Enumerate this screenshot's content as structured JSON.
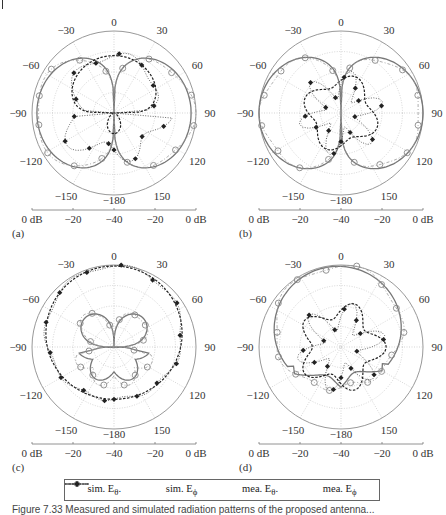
{
  "chart_data": [
    {
      "type": "polar",
      "panel": "(a)",
      "angle_ticks": [
        0,
        30,
        60,
        90,
        120,
        150,
        -180,
        -150,
        -120,
        -90,
        -60,
        -30
      ],
      "radial_scale_labels": [
        "0 dB",
        "-20",
        "-40",
        "-20",
        "0 dB"
      ],
      "rlim_db": [
        -40,
        0
      ],
      "series": [
        {
          "name": "sim. Eθ",
          "style": "solid",
          "shape": "two side lobes, nulls at 0 and 180, max near ±45 and ±135"
        },
        {
          "name": "sim. Eφ",
          "style": "dashed",
          "shape": "circle in upper half ~-12 dB, small lobe at 180"
        },
        {
          "name": "mea. Eθ",
          "style": "dash-dot with circle markers"
        },
        {
          "name": "mea. Eφ",
          "style": "dotted with diamond markers"
        }
      ]
    },
    {
      "type": "polar",
      "panel": "(b)",
      "angle_ticks": [
        0,
        30,
        60,
        90,
        120,
        150,
        -180,
        -150,
        -120,
        -90,
        -60,
        -30
      ],
      "radial_scale_labels": [
        "0 dB",
        "-20",
        "-40",
        "-20",
        "0 dB"
      ],
      "rlim_db": [
        -40,
        0
      ],
      "series": [
        {
          "name": "sim. Eθ",
          "style": "solid",
          "shape": "figure-eight lobes, nulls at 0 and 180"
        },
        {
          "name": "sim. Eφ",
          "style": "dashed",
          "shape": "low level below -20 dB"
        },
        {
          "name": "mea. Eθ",
          "style": "dash-dot with circle markers"
        },
        {
          "name": "mea. Eφ",
          "style": "dotted with diamond markers, scattered ~-20 to -30 dB"
        }
      ]
    },
    {
      "type": "polar",
      "panel": "(c)",
      "angle_ticks": [
        0,
        30,
        60,
        90,
        120,
        150,
        -180,
        -150,
        -120,
        -90,
        -60,
        -30
      ],
      "radial_scale_labels": [
        "0 dB",
        "-20",
        "-40",
        "-20",
        "0 dB"
      ],
      "rlim_db": [
        -40,
        0
      ],
      "series": [
        {
          "name": "sim. Eθ",
          "style": "solid",
          "shape": "two small lobes around ±45 at ~-18 dB"
        },
        {
          "name": "sim. Eφ",
          "style": "dashed",
          "shape": "cardioid, max 0 dB at 0°, ~-12 dB at 180°"
        },
        {
          "name": "mea. Eθ",
          "style": "dash-dot with circle markers"
        },
        {
          "name": "mea. Eφ",
          "style": "dotted with diamond markers following cardioid"
        }
      ]
    },
    {
      "type": "polar",
      "panel": "(d)",
      "angle_ticks": [
        0,
        30,
        60,
        90,
        120,
        150,
        -180,
        -150,
        -120,
        -90,
        -60,
        -30
      ],
      "radial_scale_labels": [
        "0 dB",
        "-20",
        "-40",
        "-20",
        "0 dB"
      ],
      "rlim_db": [
        -40,
        0
      ],
      "series": [
        {
          "name": "sim. Eθ",
          "style": "solid",
          "shape": "cardioid, max 0 dB near 0°, min in lower half"
        },
        {
          "name": "sim. Eφ",
          "style": "dashed",
          "shape": "low level ~-20 dB"
        },
        {
          "name": "mea. Eθ",
          "style": "dash-dot with circle markers"
        },
        {
          "name": "mea. Eφ",
          "style": "dotted with diamond markers"
        }
      ]
    }
  ],
  "panels": {
    "a": {
      "label": "(a)"
    },
    "b": {
      "label": "(b)"
    },
    "c": {
      "label": "(c)"
    },
    "d": {
      "label": "(d)"
    }
  },
  "angles": {
    "t0": "0",
    "t30": "30",
    "t60": "60",
    "t90": "90",
    "t120": "120",
    "t150": "150",
    "t180": "−180",
    "tm150": "−150",
    "tm120": "−120",
    "tm90": "−90",
    "tm60": "−60",
    "tm30": "−30"
  },
  "scale": {
    "l0": "0 dB",
    "l1": "−20",
    "l2": "−40",
    "l3": "−20",
    "l4": "0 dB"
  },
  "legend": {
    "items": [
      {
        "label": "sim. E",
        "sub": "θ",
        "suffix": "."
      },
      {
        "label": "sim. E",
        "sub": "ϕ",
        "suffix": ""
      },
      {
        "label": "mea. E",
        "sub": "θ",
        "suffix": "."
      },
      {
        "label": "mea. E",
        "sub": "ϕ",
        "suffix": ""
      }
    ]
  },
  "caption": {
    "text": "Figure 7.33   Measured and simulated radiation patterns of the proposed antenna..."
  }
}
